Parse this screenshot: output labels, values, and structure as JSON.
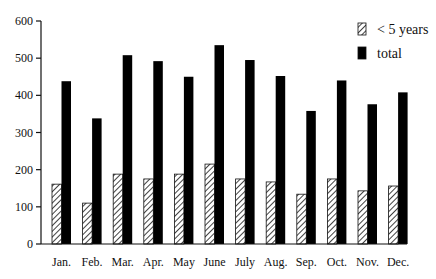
{
  "chart_data": {
    "type": "bar",
    "title": "",
    "xlabel": "",
    "ylabel": "",
    "ylim": [
      0,
      600
    ],
    "yticks": [
      0,
      100,
      200,
      300,
      400,
      500,
      600
    ],
    "grid": false,
    "legend_position": "top-right",
    "categories": [
      "Jan.",
      "Feb.",
      "Mar.",
      "Apr.",
      "May",
      "June",
      "July",
      "Aug.",
      "Sep.",
      "Oct.",
      "Nov.",
      "Dec."
    ],
    "series": [
      {
        "name": "< 5 years",
        "style": "hatched",
        "values": [
          161,
          110,
          188,
          175,
          188,
          215,
          175,
          167,
          134,
          175,
          143,
          156
        ]
      },
      {
        "name": "total",
        "style": "solid",
        "color": "#000000",
        "values": [
          438,
          338,
          508,
          492,
          450,
          535,
          495,
          452,
          358,
          440,
          376,
          408
        ]
      }
    ]
  },
  "legend": {
    "items": [
      {
        "label": "< 5 years",
        "swatch": "hatched"
      },
      {
        "label": "total",
        "swatch": "solid"
      }
    ]
  }
}
